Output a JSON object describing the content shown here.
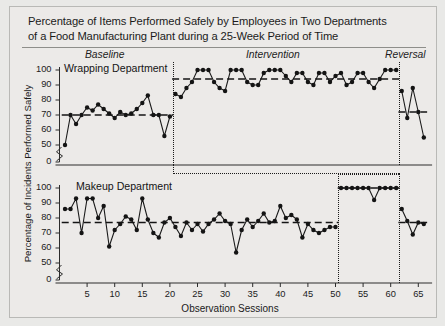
{
  "figure": {
    "title_line1": "Percentage of Items Performed Safely by Employees in Two Departments",
    "title_line2": "of a Food Manufacturing Plant during a 25-Week Period of Time",
    "ylabel": "Percentage of Incidents Performed Safely",
    "xlabel": "Observation Sessions",
    "phase_labels": {
      "baseline": "Baseline",
      "intervention": "Intervention",
      "reversal": "Reversal"
    },
    "panel_titles": {
      "top": "Wrapping Department",
      "bottom": "Makeup Department"
    }
  },
  "chart_data": {
    "type": "line",
    "title": "Percentage of Items Performed Safely by Employees in Two Departments of a Food Manufacturing Plant during a 25-Week Period of Time",
    "xlabel": "Observation Sessions",
    "ylabel": "Percentage of Incidents Performed Safely",
    "xlim": [
      0,
      67
    ],
    "ylim": [
      0,
      100
    ],
    "xticks": [
      5,
      10,
      15,
      20,
      25,
      30,
      35,
      40,
      45,
      50,
      55,
      60,
      65
    ],
    "yticks": [
      0,
      50,
      60,
      70,
      80,
      90,
      100
    ],
    "y_axis_break": true,
    "grid": false,
    "legend": "none",
    "phase_boundaries_top": [
      20.5,
      61.5
    ],
    "phase_boundaries_bottom": [
      50.5,
      61.5
    ],
    "annotations": [
      "Baseline",
      "Intervention",
      "Reversal"
    ],
    "panels": [
      {
        "name": "Wrapping Department",
        "phases": [
          {
            "label": "Baseline",
            "mean": 70,
            "x": [
              1,
              2,
              3,
              4,
              5,
              6,
              7,
              8,
              9,
              10,
              11,
              12,
              13,
              14,
              15,
              16,
              17,
              18,
              19,
              20
            ],
            "values": [
              50,
              70,
              64,
              70,
              75,
              73,
              77,
              74,
              71,
              68,
              72,
              70,
              71,
              74,
              78,
              83,
              70,
              70,
              56,
              69
            ]
          },
          {
            "label": "Intervention",
            "mean": 94,
            "x": [
              21,
              22,
              23,
              24,
              25,
              26,
              27,
              28,
              29,
              30,
              31,
              32,
              33,
              34,
              35,
              36,
              37,
              38,
              39,
              40,
              41,
              42,
              43,
              44,
              45,
              46,
              47,
              48,
              49,
              50,
              51,
              52,
              53,
              54,
              55,
              56,
              57,
              58,
              59,
              60,
              61
            ],
            "values": [
              84,
              82,
              88,
              92,
              100,
              100,
              100,
              92,
              88,
              86,
              100,
              100,
              100,
              92,
              90,
              90,
              98,
              100,
              100,
              100,
              96,
              92,
              98,
              98,
              92,
              90,
              98,
              98,
              92,
              96,
              98,
              90,
              92,
              98,
              98,
              92,
              88,
              94,
              100,
              100,
              100
            ]
          },
          {
            "label": "Reversal",
            "mean": 72,
            "x": [
              62,
              63,
              64,
              65,
              66
            ],
            "values": [
              86,
              68,
              88,
              72,
              55
            ]
          }
        ]
      },
      {
        "name": "Makeup Department",
        "phases": [
          {
            "label": "Baseline",
            "mean": 77,
            "x": [
              1,
              2,
              3,
              4,
              5,
              6,
              7,
              8,
              9,
              10,
              11,
              12,
              13,
              14,
              15,
              16,
              17,
              18,
              19,
              20,
              21,
              22,
              23,
              24,
              25,
              26,
              27,
              28,
              29,
              30,
              31,
              32,
              33,
              34,
              35,
              36,
              37,
              38,
              39,
              40,
              41,
              42,
              43,
              44,
              45,
              46,
              47,
              48,
              49,
              50
            ],
            "values": [
              86,
              86,
              93,
              70,
              93,
              93,
              80,
              88,
              61,
              72,
              76,
              81,
              79,
              72,
              93,
              79,
              70,
              67,
              77,
              80,
              74,
              68,
              77,
              72,
              76,
              71,
              76,
              79,
              83,
              78,
              76,
              57,
              72,
              79,
              74,
              78,
              83,
              77,
              78,
              88,
              80,
              82,
              79,
              67,
              76,
              72,
              70,
              72,
              74,
              74
            ]
          },
          {
            "label": "Intervention",
            "mean": 100,
            "x": [
              51,
              52,
              53,
              54,
              55,
              56,
              57,
              58,
              59,
              60,
              61
            ],
            "values": [
              100,
              100,
              100,
              100,
              100,
              100,
              92,
              100,
              100,
              100,
              100
            ]
          },
          {
            "label": "Reversal",
            "mean": 77,
            "x": [
              62,
              63,
              64,
              65,
              66
            ],
            "values": [
              86,
              78,
              69,
              77,
              76
            ]
          }
        ]
      }
    ]
  }
}
